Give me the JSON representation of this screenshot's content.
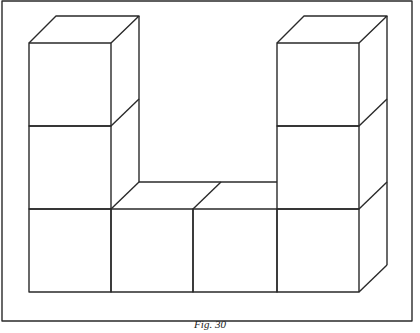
{
  "figure": {
    "caption": "Fig. 30",
    "structure": {
      "left_tower_height": 3,
      "right_tower_height": 3,
      "bottom_row_length": 4
    },
    "colors": {
      "line": "#2a2a2a",
      "background": "#ffffff"
    }
  }
}
